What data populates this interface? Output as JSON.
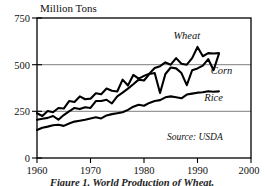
{
  "figure": {
    "background": "#ffffff",
    "line_color": "#000000",
    "grid_color": "#6f6f6f",
    "caption": "Figure 1. World Production of Wheat,"
  },
  "chart_data": {
    "type": "line",
    "title": "",
    "ylabel": "Million Tons",
    "xlabel": "",
    "xlim": [
      1960,
      2000
    ],
    "ylim": [
      0,
      750
    ],
    "yticks": [
      0,
      250,
      500,
      750
    ],
    "ytick_labels": [
      "0",
      "250",
      "500",
      "750"
    ],
    "xticks": [
      1960,
      1970,
      1980,
      1990,
      2000
    ],
    "xtick_labels": [
      "1960",
      "1970",
      "1980",
      "1990",
      "2000"
    ],
    "gridlines_y": [
      250,
      500
    ],
    "grid": true,
    "legend_position": "inline-labels",
    "annotations": [
      {
        "text": "Wheat",
        "x": 1988.0,
        "y": 640
      },
      {
        "text": "Corn",
        "x": 1994.5,
        "y": 452
      },
      {
        "text": "Rice",
        "x": 1993.0,
        "y": 305
      },
      {
        "text": "Source: USDA",
        "x": 1989.5,
        "y": 95
      }
    ],
    "x": [
      1960,
      1961,
      1962,
      1963,
      1964,
      1965,
      1966,
      1967,
      1968,
      1969,
      1970,
      1971,
      1972,
      1973,
      1974,
      1975,
      1976,
      1977,
      1978,
      1979,
      1980,
      1981,
      1982,
      1983,
      1984,
      1985,
      1986,
      1987,
      1988,
      1989,
      1990,
      1991,
      1992,
      1993,
      1994
    ],
    "series": [
      {
        "name": "Wheat",
        "values": [
          240,
          225,
          252,
          245,
          268,
          265,
          305,
          300,
          330,
          315,
          318,
          347,
          342,
          372,
          360,
          356,
          420,
          388,
          445,
          425,
          440,
          452,
          482,
          492,
          512,
          500,
          535,
          505,
          500,
          535,
          595,
          545,
          562,
          560,
          562
        ]
      },
      {
        "name": "Corn",
        "values": [
          205,
          210,
          215,
          225,
          205,
          230,
          250,
          268,
          262,
          272,
          268,
          305,
          305,
          312,
          292,
          330,
          350,
          372,
          395,
          420,
          415,
          450,
          455,
          348,
          450,
          485,
          480,
          455,
          390,
          470,
          480,
          495,
          530,
          470,
          558
        ]
      },
      {
        "name": "Rice",
        "values": [
          150,
          162,
          168,
          175,
          178,
          172,
          185,
          195,
          200,
          205,
          212,
          218,
          212,
          228,
          235,
          240,
          245,
          258,
          275,
          285,
          280,
          295,
          305,
          310,
          325,
          330,
          325,
          320,
          340,
          345,
          350,
          352,
          358,
          355,
          357
        ]
      }
    ]
  }
}
